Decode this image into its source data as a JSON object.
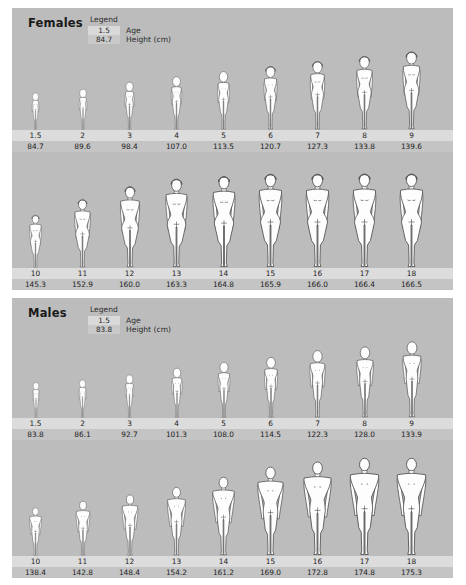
{
  "chart_data": {
    "type": "table",
    "xlabel": "Age",
    "ylabel": "Height (cm)",
    "series": [
      {
        "name": "Females",
        "categories": [
          1.5,
          2,
          3,
          4,
          5,
          6,
          7,
          8,
          9,
          10,
          11,
          12,
          13,
          14,
          15,
          16,
          17,
          18
        ],
        "values": [
          84.7,
          89.6,
          98.4,
          107.0,
          113.5,
          120.7,
          127.3,
          133.8,
          139.6,
          145.3,
          152.9,
          160.0,
          163.3,
          164.8,
          165.9,
          166.0,
          166.4,
          166.5
        ]
      },
      {
        "name": "Males",
        "categories": [
          1.5,
          2,
          3,
          4,
          5,
          6,
          7,
          8,
          9,
          10,
          11,
          12,
          13,
          14,
          15,
          16,
          17,
          18
        ],
        "values": [
          83.8,
          86.1,
          92.7,
          101.3,
          108.0,
          114.5,
          122.3,
          128.0,
          133.9,
          138.4,
          142.8,
          148.4,
          154.2,
          161.2,
          169.0,
          172.8,
          174.8,
          175.3
        ]
      }
    ]
  },
  "colors": {
    "panel_background": "#bcbcbc",
    "age_strip": "#dcdcdc",
    "height_strip": "#c4c4c4",
    "figure_fill": "#fdfdfd",
    "figure_outline": "#4a4a4a",
    "text": "#1d1d1d"
  },
  "females": {
    "title": "Females",
    "legend": {
      "title": "Legend",
      "age_sample": "1.5",
      "age_key": "Age",
      "height_sample": "84.7",
      "height_key": "Height (cm)"
    },
    "row1": {
      "ages": [
        "1.5",
        "2",
        "3",
        "4",
        "5",
        "6",
        "7",
        "8",
        "9"
      ],
      "heights": [
        "84.7",
        "89.6",
        "98.4",
        "107.0",
        "113.5",
        "120.7",
        "127.3",
        "133.8",
        "139.6"
      ]
    },
    "row2": {
      "ages": [
        "10",
        "11",
        "12",
        "13",
        "14",
        "15",
        "16",
        "17",
        "18"
      ],
      "heights": [
        "145.3",
        "152.9",
        "160.0",
        "163.3",
        "164.8",
        "165.9",
        "166.0",
        "166.4",
        "166.5"
      ]
    }
  },
  "males": {
    "title": "Males",
    "legend": {
      "title": "Legend",
      "age_sample": "1.5",
      "age_key": "Age",
      "height_sample": "83.8",
      "height_key": "Height (cm)"
    },
    "row1": {
      "ages": [
        "1.5",
        "2",
        "3",
        "4",
        "5",
        "6",
        "7",
        "8",
        "9"
      ],
      "heights": [
        "83.8",
        "86.1",
        "92.7",
        "101.3",
        "108.0",
        "114.5",
        "122.3",
        "128.0",
        "133.9"
      ]
    },
    "row2": {
      "ages": [
        "10",
        "11",
        "12",
        "13",
        "14",
        "15",
        "16",
        "17",
        "18"
      ],
      "heights": [
        "138.4",
        "142.8",
        "148.4",
        "154.2",
        "161.2",
        "169.0",
        "172.8",
        "174.8",
        "175.3"
      ]
    }
  }
}
